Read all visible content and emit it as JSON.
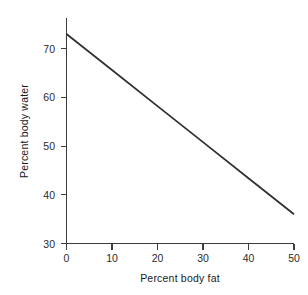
{
  "chart_data": {
    "type": "line",
    "title": "",
    "subtitle": "",
    "xlabel": "Percent body fat",
    "ylabel": "Percent body water",
    "xlim": [
      0,
      50
    ],
    "ylim": [
      30,
      75
    ],
    "xticks": [
      0,
      10,
      20,
      30,
      40,
      50
    ],
    "xtick_labels": [
      "0",
      "10",
      "20",
      "30",
      "40",
      "50"
    ],
    "yticks": [
      30,
      40,
      50,
      60,
      70
    ],
    "ytick_labels": [
      "30",
      "40",
      "50",
      "60",
      "70"
    ],
    "grid": false,
    "legend": null,
    "series": [
      {
        "name": "body water vs body fat",
        "x": [
          0,
          10,
          20,
          30,
          40,
          50
        ],
        "values": [
          73.0,
          65.6,
          58.2,
          50.8,
          43.4,
          36.0
        ],
        "color": "#2f2f2f"
      }
    ],
    "annotations": []
  },
  "axes": {
    "x_tick_0": "0",
    "x_tick_1": "10",
    "x_tick_2": "20",
    "x_tick_3": "30",
    "x_tick_4": "40",
    "x_tick_5": "50",
    "y_tick_0": "30",
    "y_tick_1": "40",
    "y_tick_2": "50",
    "y_tick_3": "60",
    "y_tick_4": "70",
    "x_title": "Percent body fat",
    "y_title": "Percent body water"
  },
  "style": {
    "background": "#ffffff",
    "axis_color": "#3c3c3c",
    "line_color": "#2f2f2f",
    "text_color": "#1a1a1a"
  }
}
